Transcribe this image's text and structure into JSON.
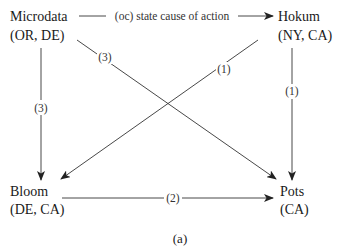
{
  "nodes": {
    "microdata": {
      "name": "Microdata",
      "states": "(OR, DE)"
    },
    "hokum": {
      "name": "Hokum",
      "states": "(NY, CA)"
    },
    "bloom": {
      "name": "Bloom",
      "states": "(DE, CA)"
    },
    "pots": {
      "name": "Pots",
      "states": "(CA)"
    }
  },
  "edges": [
    {
      "from": "Microdata",
      "to": "Hokum",
      "label": "(oc) state cause of action"
    },
    {
      "from": "Microdata",
      "to": "Bloom",
      "label": "(3)"
    },
    {
      "from": "Microdata",
      "to": "Pots",
      "label": "(3)"
    },
    {
      "from": "Hokum",
      "to": "Bloom",
      "label": "(1)"
    },
    {
      "from": "Hokum",
      "to": "Pots",
      "label": "(1)"
    },
    {
      "from": "Bloom",
      "to": "Pots",
      "label": "(2)"
    }
  ],
  "caption": "(a)"
}
